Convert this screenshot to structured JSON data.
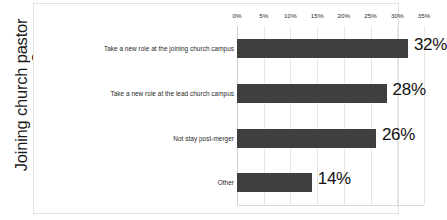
{
  "chart_data": {
    "type": "bar",
    "orientation": "horizontal",
    "title": "",
    "xlabel": "",
    "ylabel": "Joining church pastor stay or . . .?",
    "ylabel_lines": [
      "Joining church pastor",
      "stay or . . .?"
    ],
    "categories": [
      "Take a new role at the joining church campus",
      "Take a new role at the lead church campus",
      "Not stay post-merger",
      "Other"
    ],
    "values": [
      32,
      28,
      26,
      14
    ],
    "value_labels": [
      "32%",
      "28%",
      "26%",
      "14%"
    ],
    "xlim": [
      0,
      35
    ],
    "xticks": [
      0,
      5,
      10,
      15,
      20,
      25,
      30,
      35
    ],
    "xtick_labels": [
      "0%",
      "5%",
      "10%",
      "15%",
      "20%",
      "25%",
      "30%",
      "35%"
    ],
    "grid": true,
    "grid_axis": "x",
    "legend": false,
    "legend_position": "none",
    "bar_color": "#3f3f3f",
    "gridline_color": "#e6e6e6",
    "plot_background": "#ffffff",
    "frame_color": "#e2e2e2",
    "data_label_color": "#111111"
  }
}
